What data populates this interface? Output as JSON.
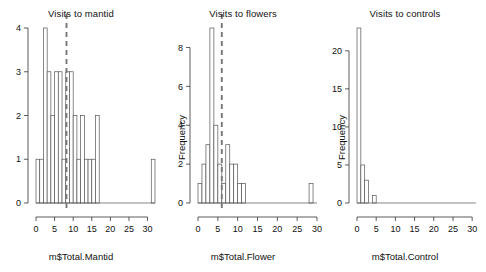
{
  "figure": {
    "background_color": "#ffffff",
    "bar_stroke_color": "#555555",
    "axis_color": "#333333",
    "mean_line_color": "#777777"
  },
  "panels": [
    {
      "id": "mantid",
      "title": "Visits to mantid",
      "xlabel": "m$Total.Mantid",
      "ylabel": "",
      "ylabel_visible": false
    },
    {
      "id": "flowers",
      "title": "Visits to flowers",
      "xlabel": "m$Total.Flower",
      "ylabel": "Frequency",
      "ylabel_visible": true
    },
    {
      "id": "controls",
      "title": "Visits to controls",
      "xlabel": "m$Total.Control",
      "ylabel": "Frequency",
      "ylabel_visible": true
    }
  ],
  "chart_data": [
    {
      "type": "bar",
      "id": "mantid",
      "title": "Visits to mantid",
      "xlabel": "m$Total.Mantid",
      "ylabel": "Frequency",
      "ylabel_shown": false,
      "bin_width": 1,
      "xlim": [
        0,
        32
      ],
      "ylim": [
        0,
        4
      ],
      "xticks": [
        0,
        5,
        10,
        15,
        20,
        25,
        30
      ],
      "yticks": [
        0,
        1,
        2,
        3,
        4
      ],
      "grid": false,
      "legend": false,
      "bin_starts": [
        0,
        1,
        2,
        3,
        4,
        5,
        6,
        7,
        8,
        9,
        10,
        11,
        12,
        13,
        14,
        15,
        16,
        17,
        18,
        19,
        20,
        21,
        22,
        23,
        24,
        25,
        26,
        27,
        28,
        29,
        30,
        31
      ],
      "values": [
        1,
        1,
        4,
        3,
        2,
        3,
        3,
        1,
        3,
        3,
        2,
        1,
        2,
        1,
        1,
        1,
        2,
        0,
        0,
        0,
        0,
        0,
        0,
        0,
        0,
        0,
        0,
        0,
        0,
        0,
        0,
        1
      ],
      "mean_line": 8.2,
      "mean_line_style": "dashed"
    },
    {
      "type": "bar",
      "id": "flowers",
      "title": "Visits to flowers",
      "xlabel": "m$Total.Flower",
      "ylabel": "Frequency",
      "ylabel_shown": true,
      "bin_width": 1,
      "xlim": [
        0,
        30
      ],
      "ylim": [
        0,
        9
      ],
      "xticks": [
        0,
        5,
        10,
        15,
        20,
        25,
        30
      ],
      "yticks": [
        0,
        2,
        4,
        6,
        8
      ],
      "grid": false,
      "legend": false,
      "bin_starts": [
        0,
        1,
        2,
        3,
        4,
        5,
        6,
        7,
        8,
        9,
        10,
        11,
        12,
        13,
        14,
        15,
        16,
        17,
        18,
        19,
        20,
        21,
        22,
        23,
        24,
        25,
        26,
        27,
        28,
        29
      ],
      "values": [
        1,
        2,
        3,
        9,
        4,
        2,
        1,
        3,
        2,
        2,
        1,
        1,
        0,
        0,
        0,
        0,
        0,
        0,
        0,
        0,
        0,
        0,
        0,
        0,
        0,
        0,
        0,
        0,
        1,
        0
      ],
      "mean_line": 6.0,
      "mean_line_style": "dashed"
    },
    {
      "type": "bar",
      "id": "controls",
      "title": "Visits to controls",
      "xlabel": "m$Total.Control",
      "ylabel": "Frequency",
      "ylabel_shown": true,
      "bin_width": 1,
      "xlim": [
        0,
        31
      ],
      "ylim": [
        0,
        23
      ],
      "xticks": [
        0,
        5,
        10,
        15,
        20,
        25,
        30
      ],
      "yticks": [
        0,
        5,
        10,
        15,
        20
      ],
      "grid": false,
      "legend": false,
      "bin_starts": [
        0,
        1,
        2,
        3,
        4,
        5,
        6,
        7,
        8,
        9,
        10,
        11,
        12,
        13,
        14,
        15,
        16,
        17,
        18,
        19,
        20,
        21,
        22,
        23,
        24,
        25,
        26,
        27,
        28,
        29,
        30
      ],
      "values": [
        23,
        5,
        3,
        0,
        1,
        0,
        0,
        0,
        0,
        0,
        0,
        0,
        0,
        0,
        0,
        0,
        0,
        0,
        0,
        0,
        0,
        0,
        0,
        0,
        0,
        0,
        0,
        0,
        0,
        0,
        0
      ],
      "mean_line": null,
      "mean_line_style": "none"
    }
  ]
}
